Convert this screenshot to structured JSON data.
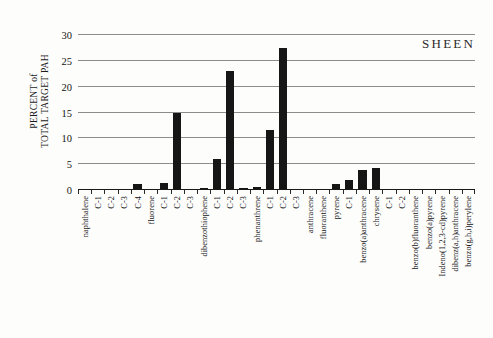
{
  "chart_data": {
    "type": "bar",
    "title": "",
    "annotation": "SHEEN",
    "xlabel": "",
    "ylabel": "PERCENT of\nTOTAL TARGET PAH",
    "ylim": [
      0,
      30
    ],
    "yticks": [
      0,
      5,
      10,
      15,
      20,
      25,
      30
    ],
    "ytick_labels": [
      "0",
      "5",
      "10",
      "15",
      "20",
      "25",
      "30"
    ],
    "grid": true,
    "legend": null,
    "bar_color": "#161616",
    "categories": [
      "naphthalene",
      "C-1",
      "C-2",
      "C-3",
      "C-4",
      "fluorene",
      "C-1",
      "C-2",
      "C-3",
      "dibenzothiophene",
      "C-1",
      "C-2",
      "C-3",
      "phenanthrene",
      "C-1",
      "C-2",
      "C-3",
      "anthracene",
      "fluoranthene",
      "pyrene",
      "C-1",
      "benzo(a)anthracene",
      "chrysene",
      "C-1",
      "C-2",
      "benzo(b)fluoranthene",
      "benzo(a)pyrene",
      "Indeno(1,2,3-cd)pyrene",
      "dibenz(a,h)anthracene",
      "benzo(g,h,i)perylene"
    ],
    "values": [
      0,
      0,
      0,
      0,
      1.2,
      0,
      1.4,
      15.0,
      0,
      0.4,
      6.0,
      23.0,
      0.3,
      0.5,
      11.7,
      27.5,
      0,
      0,
      0,
      1.1,
      1.9,
      3.9,
      4.3,
      0,
      0,
      0,
      0,
      0,
      0,
      0
    ]
  }
}
